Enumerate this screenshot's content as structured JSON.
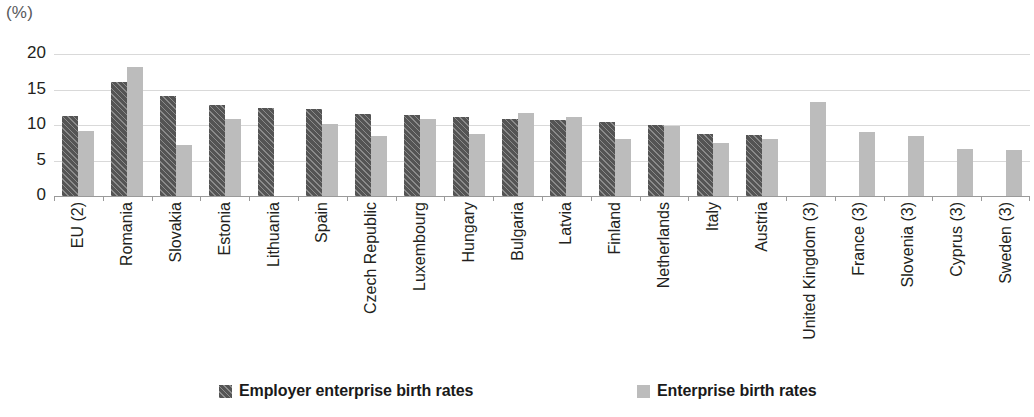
{
  "chart_data": {
    "type": "bar",
    "title": "",
    "subtitle": "",
    "xlabel": "",
    "ylabel": "",
    "unit_label": "(%)",
    "ylim": [
      0,
      20
    ],
    "yticks": [
      0,
      5,
      10,
      15,
      20
    ],
    "ytick_labels": [
      "0",
      "5",
      "10",
      "15",
      "20"
    ],
    "grid": true,
    "grid_axis": "y",
    "legend_position": "bottom",
    "categories": [
      "EU (2)",
      "Romania",
      "Slovakia",
      "Estonia",
      "Lithuania",
      "Spain",
      "Czech Republic",
      "Luxembourg",
      "Hungary",
      "Bulgaria",
      "Latvia",
      "Finland",
      "Netherlands",
      "Italy",
      "Austria",
      "United Kingdom (3)",
      "France (3)",
      "Slovenia (3)",
      "Cyprus (3)",
      "Sweden (3)"
    ],
    "series": [
      {
        "name": "Employer enterprise birth rates",
        "color": "#545454",
        "pattern": "diagonal-hatch",
        "values": [
          11.3,
          16.0,
          14.1,
          12.8,
          12.4,
          12.2,
          11.5,
          11.4,
          11.1,
          10.8,
          10.7,
          10.4,
          10.0,
          8.8,
          8.6,
          null,
          null,
          null,
          null,
          null
        ]
      },
      {
        "name": "Enterprise birth rates",
        "color": "#bcbcbc",
        "pattern": "solid",
        "values": [
          9.2,
          18.2,
          7.2,
          10.8,
          null,
          10.2,
          8.5,
          10.9,
          8.8,
          11.7,
          11.1,
          8.1,
          9.8,
          7.4,
          8.0,
          13.2,
          9.0,
          8.4,
          6.6,
          6.5
        ]
      }
    ]
  }
}
